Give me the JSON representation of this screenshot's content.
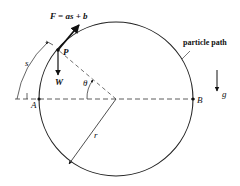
{
  "diagram": {
    "force_label": "F = as + b",
    "point_p": "P",
    "weight": "W",
    "arc_length": "s",
    "angle": "θ",
    "point_a": "A",
    "point_b": "B",
    "radius": "r",
    "gravity": "g",
    "path_label": "particle path"
  }
}
